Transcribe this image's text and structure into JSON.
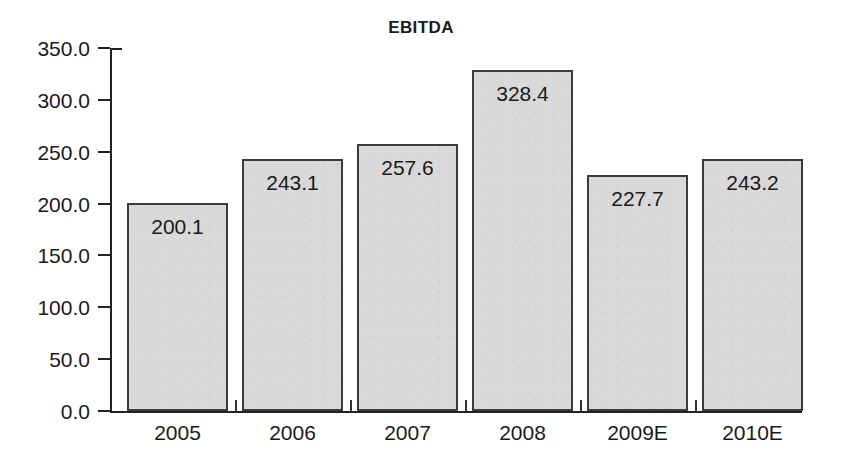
{
  "chart_data": {
    "type": "bar",
    "title": "EBITDA",
    "xlabel": "",
    "ylabel": "",
    "categories": [
      "2005",
      "2006",
      "2007",
      "2008",
      "2009E",
      "2010E"
    ],
    "values": [
      200.1,
      243.1,
      257.6,
      328.4,
      227.7,
      243.2
    ],
    "value_labels": [
      "200.1",
      "243.1",
      "257.6",
      "328.4",
      "227.7",
      "243.2"
    ],
    "ylim": [
      0,
      350
    ],
    "ytick_values": [
      350,
      300,
      250,
      200,
      150,
      100,
      50,
      0
    ],
    "ytick_labels": [
      "350.0",
      "300.0",
      "250.0",
      "200.0",
      "150.0",
      "100.0",
      "50.0",
      "0.0"
    ],
    "grid": false,
    "legend": null,
    "bar_fill_color": "#d9d9d9",
    "bar_border_color": "#3b3b3b",
    "axis_color": "#222222",
    "text_color": "#1a1a1a",
    "background_color": "#ffffff"
  }
}
